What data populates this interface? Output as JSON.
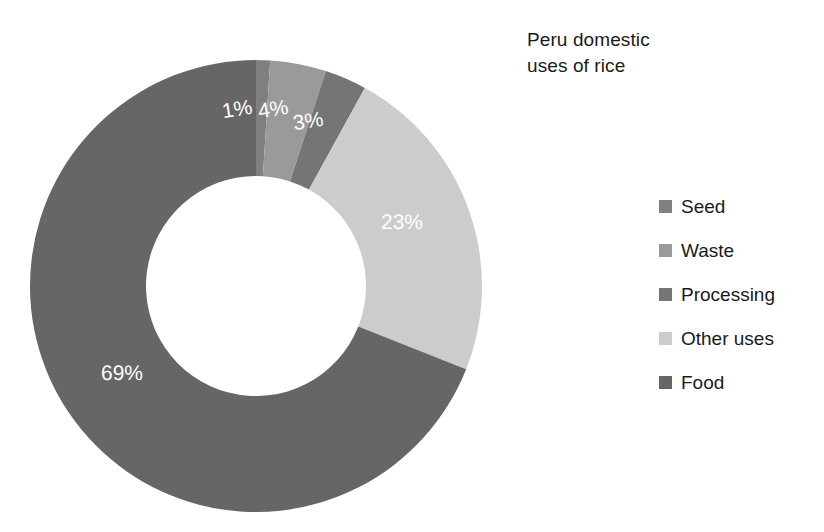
{
  "chart_data": {
    "type": "pie",
    "variant": "donut",
    "title": "Peru domestic\nuses of rice",
    "xlabel": "",
    "ylabel": "",
    "grid": false,
    "legend_position": "right",
    "start_angle_deg": 0,
    "direction": "clockwise",
    "units": "percent",
    "categories": [
      "Seed",
      "Waste",
      "Processing",
      "Other uses",
      "Food"
    ],
    "values": [
      1,
      4,
      3,
      23,
      69
    ],
    "labels": [
      "1%",
      "4%",
      "3%",
      "23%",
      "69%"
    ],
    "colors": [
      "#808080",
      "#9a9a9a",
      "#757575",
      "#cccccc",
      "#666666"
    ],
    "slices": [
      {
        "name": "Seed",
        "value": 1,
        "label": "1%",
        "color": "#808080"
      },
      {
        "name": "Waste",
        "value": 4,
        "label": "4%",
        "color": "#9a9a9a"
      },
      {
        "name": "Processing",
        "value": 3,
        "label": "3%",
        "color": "#757575"
      },
      {
        "name": "Other uses",
        "value": 23,
        "label": "23%",
        "color": "#cccccc"
      },
      {
        "name": "Food",
        "value": 69,
        "label": "69%",
        "color": "#666666"
      }
    ]
  },
  "legend": {
    "items": [
      {
        "label": "Seed",
        "color": "#808080"
      },
      {
        "label": "Waste",
        "color": "#9a9a9a"
      },
      {
        "label": "Processing",
        "color": "#757575"
      },
      {
        "label": "Other uses",
        "color": "#cccccc"
      },
      {
        "label": "Food",
        "color": "#666666"
      }
    ]
  },
  "data_labels": [
    {
      "text": "1%",
      "x": 222,
      "y": 99,
      "rotate": -9
    },
    {
      "text": "4%",
      "x": 258,
      "y": 99,
      "rotate": -9
    },
    {
      "text": "23%",
      "x": 381,
      "y": 212,
      "rotate": 0
    },
    {
      "text": "3%",
      "x": 293,
      "y": 111,
      "rotate": -9
    },
    {
      "text": "69%",
      "x": 101,
      "y": 363,
      "rotate": 0
    }
  ]
}
